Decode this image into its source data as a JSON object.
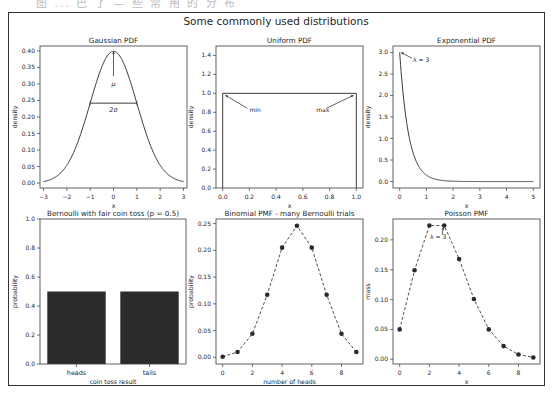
{
  "header_clip_text": "图 ... 巴 了 —  些 常 用 的 分 布",
  "suptitle": "Some commonly used distributions",
  "chart_data": [
    {
      "id": "gaussian",
      "type": "line",
      "title": "Gaussian PDF",
      "xlabel": "x",
      "ylabel": "density",
      "xlim": [
        -3.15,
        3.15
      ],
      "ylim": [
        -0.015,
        0.415
      ],
      "xticks": [
        -3,
        -2,
        -1,
        0,
        1,
        2,
        3
      ],
      "xticklabels": [
        "−3",
        "−2",
        "−1",
        "0",
        "1",
        "2",
        "3"
      ],
      "yticks": [
        0.0,
        0.05,
        0.1,
        0.15,
        0.2,
        0.25,
        0.3,
        0.35,
        0.4
      ],
      "yticklabels": [
        "0.00",
        "0.05",
        "0.10",
        "0.15",
        "0.20",
        "0.25",
        "0.30",
        "0.35",
        "0.40"
      ],
      "function": "normal",
      "params": {
        "mu": 0,
        "sigma": 1
      },
      "x_range": [
        -3,
        3
      ],
      "annotations": [
        {
          "text": "μ",
          "x": 0,
          "y": 0.3,
          "arrow_to": [
            0,
            0.399
          ]
        },
        {
          "text": "2σ",
          "x": 0,
          "y": 0.22,
          "hline": [
            -1,
            1,
            0.242
          ]
        }
      ]
    },
    {
      "id": "uniform",
      "type": "line",
      "title": "Uniform PDF",
      "xlabel": "x",
      "ylabel": "density",
      "xlim": [
        -0.05,
        1.05
      ],
      "ylim": [
        0,
        1.5
      ],
      "xticks": [
        0.0,
        0.2,
        0.4,
        0.6,
        0.8,
        1.0
      ],
      "xticklabels": [
        "0.0",
        "0.2",
        "0.4",
        "0.6",
        "0.8",
        "1.0"
      ],
      "yticks": [
        0.0,
        0.2,
        0.4,
        0.6,
        0.8,
        1.0,
        1.2,
        1.4
      ],
      "yticklabels": [
        "0.0",
        "0.2",
        "0.4",
        "0.6",
        "0.8",
        "1.0",
        "1.2",
        "1.4"
      ],
      "x": [
        0,
        0,
        1,
        1
      ],
      "y": [
        0,
        1,
        1,
        0
      ],
      "annotations": [
        {
          "text": "min",
          "x": 0.2,
          "y": 0.82,
          "arrow_to": [
            0.02,
            0.98
          ]
        },
        {
          "text": "max",
          "x": 0.7,
          "y": 0.82,
          "arrow_to": [
            0.98,
            0.98
          ]
        }
      ]
    },
    {
      "id": "exponential",
      "type": "line",
      "title": "Exponential PDF",
      "xlabel": "x",
      "ylabel": "density",
      "xlim": [
        -0.25,
        5.25
      ],
      "ylim": [
        -0.15,
        3.15
      ],
      "xticks": [
        0,
        1,
        2,
        3,
        4,
        5
      ],
      "xticklabels": [
        "0",
        "1",
        "2",
        "3",
        "4",
        "5"
      ],
      "yticks": [
        0.0,
        0.5,
        1.0,
        1.5,
        2.0,
        2.5,
        3.0
      ],
      "yticklabels": [
        "0.0",
        "0.5",
        "1.0",
        "1.5",
        "2.0",
        "2.5",
        "3.0"
      ],
      "function": "exponential",
      "params": {
        "lambda": 3
      },
      "x_range": [
        0,
        5
      ],
      "annotations": [
        {
          "text": "λ = 3",
          "x": 0.5,
          "y": 2.82,
          "arrow_to": [
            0.05,
            3.0
          ]
        }
      ]
    },
    {
      "id": "bernoulli",
      "type": "bar",
      "title": "Bernoulli with fair coin toss (p = 0.5)",
      "xlabel": "coin toss result",
      "ylabel": "probability",
      "categories": [
        "heads",
        "tails"
      ],
      "values": [
        0.5,
        0.5
      ],
      "ylim": [
        0,
        1.0
      ],
      "yticks": [
        0.0,
        0.2,
        0.4,
        0.6,
        0.8,
        1.0
      ],
      "yticklabels": [
        "0.0",
        "0.2",
        "0.4",
        "0.6",
        "0.8",
        "1.0"
      ],
      "bar_color": "#2b2b2b"
    },
    {
      "id": "binomial",
      "type": "line",
      "title": "Binomial PMF - many Bernoulli trials",
      "xlabel": "number of heads",
      "ylabel": "probability",
      "x": [
        0,
        1,
        2,
        3,
        4,
        5,
        6,
        7,
        8,
        9
      ],
      "y": [
        0.001,
        0.01,
        0.044,
        0.117,
        0.205,
        0.246,
        0.205,
        0.117,
        0.044,
        0.01
      ],
      "xlim": [
        -0.45,
        9.45
      ],
      "ylim": [
        -0.0125,
        0.2585
      ],
      "xticks": [
        0,
        2,
        4,
        6,
        8
      ],
      "xticklabels": [
        "0",
        "2",
        "4",
        "6",
        "8"
      ],
      "yticks": [
        0.0,
        0.05,
        0.1,
        0.15,
        0.2,
        0.25
      ],
      "yticklabels": [
        "0.00",
        "0.05",
        "0.10",
        "0.15",
        "0.20",
        "0.25"
      ],
      "style": "dashed-with-markers"
    },
    {
      "id": "poisson",
      "type": "line",
      "title": "Poisson PMF",
      "xlabel": "x",
      "ylabel": "mass",
      "x": [
        0,
        1,
        2,
        3,
        4,
        5,
        6,
        7,
        8,
        9
      ],
      "y": [
        0.05,
        0.149,
        0.224,
        0.224,
        0.168,
        0.101,
        0.05,
        0.022,
        0.008,
        0.003
      ],
      "xlim": [
        -0.45,
        9.45
      ],
      "ylim": [
        -0.008,
        0.235
      ],
      "xticks": [
        0,
        2,
        4,
        6,
        8
      ],
      "xticklabels": [
        "0",
        "2",
        "4",
        "6",
        "8"
      ],
      "yticks": [
        0.0,
        0.05,
        0.1,
        0.15,
        0.2
      ],
      "yticklabels": [
        "0.00",
        "0.05",
        "0.10",
        "0.15",
        "0.20"
      ],
      "style": "dashed-with-markers",
      "annotations": [
        {
          "text": "λ = 3",
          "x": 2.05,
          "y": 0.205,
          "arrow_to": [
            2.95,
            0.222
          ]
        }
      ]
    }
  ],
  "layout": {
    "axes_boxes": {
      "gaussian": [
        40,
        46,
        187,
        188
      ],
      "uniform": [
        216,
        46,
        363,
        188
      ],
      "exponential": [
        393,
        46,
        540,
        188
      ],
      "bernoulli": [
        40,
        219,
        186,
        364
      ],
      "binomial": [
        216,
        219,
        363,
        364
      ],
      "poisson": [
        393,
        219,
        540,
        364
      ]
    }
  }
}
